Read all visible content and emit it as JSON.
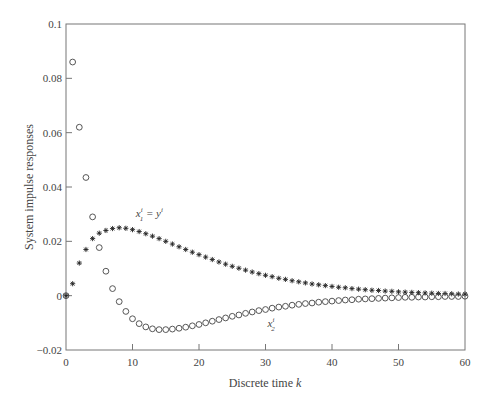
{
  "chart_data": {
    "type": "scatter",
    "title": "",
    "xlabel": "Discrete time k",
    "ylabel": "System impulse responses",
    "xlim": [
      0,
      60
    ],
    "ylim": [
      -0.02,
      0.1
    ],
    "xticks": [
      0,
      10,
      20,
      30,
      40,
      50,
      60
    ],
    "xtick_labels": [
      "0",
      "10",
      "20",
      "30",
      "40",
      "50",
      "60"
    ],
    "yticks": [
      -0.02,
      0,
      0.02,
      0.04,
      0.06,
      0.08,
      0.1
    ],
    "ytick_labels": [
      "−0.02",
      "0",
      "0.02",
      "0.04",
      "0.06",
      "0.08",
      "0.1"
    ],
    "grid": false,
    "annotations": [
      {
        "text": "x1i = yi",
        "label_main": "x",
        "sub": "1",
        "sup": "i",
        "eq": " = y",
        "sup2": "i",
        "x": 10.5,
        "y": 0.029
      },
      {
        "text": "x2i",
        "label_main": "x",
        "sub": "2",
        "sup": "i",
        "x": 30.3,
        "y": -0.0115
      }
    ],
    "series": [
      {
        "name": "x1^i = y^i",
        "marker": "asterisk",
        "x": [
          0,
          1,
          2,
          3,
          4,
          5,
          6,
          7,
          8,
          9,
          10,
          11,
          12,
          13,
          14,
          15,
          16,
          17,
          18,
          19,
          20,
          21,
          22,
          23,
          24,
          25,
          26,
          27,
          28,
          29,
          30,
          31,
          32,
          33,
          34,
          35,
          36,
          37,
          38,
          39,
          40,
          41,
          42,
          43,
          44,
          45,
          46,
          47,
          48,
          49,
          50,
          51,
          52,
          53,
          54,
          55,
          56,
          57,
          58,
          59,
          60
        ],
        "values": [
          0,
          0.0044,
          0.012,
          0.017,
          0.021,
          0.023,
          0.024,
          0.0247,
          0.025,
          0.0248,
          0.0243,
          0.0236,
          0.0228,
          0.0219,
          0.021,
          0.02,
          0.019,
          0.018,
          0.017,
          0.016,
          0.0151,
          0.0142,
          0.0133,
          0.0124,
          0.0116,
          0.0108,
          0.0101,
          0.0094,
          0.0087,
          0.0081,
          0.0075,
          0.007,
          0.0064,
          0.006,
          0.0055,
          0.0051,
          0.0047,
          0.0043,
          0.004,
          0.0037,
          0.0034,
          0.0031,
          0.0029,
          0.0026,
          0.0024,
          0.0022,
          0.002,
          0.0019,
          0.0017,
          0.0016,
          0.0014,
          0.0013,
          0.0012,
          0.0011,
          0.001,
          0.0009,
          0.0008,
          0.0008,
          0.0007,
          0.0006,
          0.0006
        ]
      },
      {
        "name": "x2^i",
        "marker": "circle",
        "x": [
          0,
          1,
          2,
          3,
          4,
          5,
          6,
          7,
          8,
          9,
          10,
          11,
          12,
          13,
          14,
          15,
          16,
          17,
          18,
          19,
          20,
          21,
          22,
          23,
          24,
          25,
          26,
          27,
          28,
          29,
          30,
          31,
          32,
          33,
          34,
          35,
          36,
          37,
          38,
          39,
          40,
          41,
          42,
          43,
          44,
          45,
          46,
          47,
          48,
          49,
          50,
          51,
          52,
          53,
          54,
          55,
          56,
          57,
          58,
          59,
          60
        ],
        "values": [
          0,
          0.086,
          0.062,
          0.0435,
          0.029,
          0.0177,
          0.009,
          0.0026,
          -0.0022,
          -0.0058,
          -0.0085,
          -0.0103,
          -0.0115,
          -0.0122,
          -0.0125,
          -0.0125,
          -0.0123,
          -0.012,
          -0.0116,
          -0.0111,
          -0.0106,
          -0.01,
          -0.0094,
          -0.0088,
          -0.0082,
          -0.0076,
          -0.0071,
          -0.0065,
          -0.006,
          -0.0055,
          -0.0051,
          -0.0046,
          -0.0042,
          -0.0039,
          -0.0035,
          -0.0032,
          -0.0029,
          -0.0027,
          -0.0024,
          -0.0022,
          -0.002,
          -0.0018,
          -0.0016,
          -0.0015,
          -0.0013,
          -0.0012,
          -0.0011,
          -0.001,
          -0.0009,
          -0.0008,
          -0.0007,
          -0.0006,
          -0.0006,
          -0.0005,
          -0.0005,
          -0.0004,
          -0.0004,
          -0.0003,
          -0.0003,
          -0.0003,
          -0.0002
        ]
      }
    ]
  },
  "axes": {
    "xlabel_main": "Discrete time ",
    "xlabel_var": "k",
    "ylabel": "System impulse responses"
  }
}
